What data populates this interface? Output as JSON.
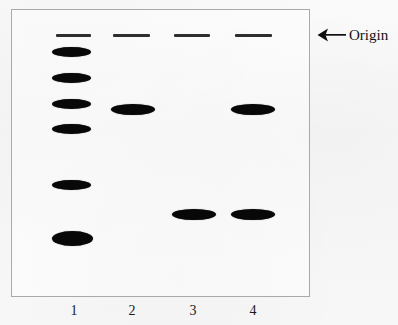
{
  "figure": {
    "type": "gel-electrophoresis-diagram",
    "background_color": "#f6f6f6",
    "band_color": "#080808",
    "plate_border_color": "#a9a9a9",
    "annotation": {
      "arrow_icon": "left-arrow-icon",
      "label": "Origin"
    },
    "plate": {
      "x": 11,
      "y": 9,
      "width": 299,
      "height": 288
    },
    "lanes": [
      {
        "number": "1",
        "label_x": 74,
        "origin": {
          "x": 56,
          "y": 34,
          "width": 35,
          "height": 3
        },
        "bands": [
          {
            "x": 52,
            "y": 47,
            "width": 39,
            "height": 10
          },
          {
            "x": 52,
            "y": 73,
            "width": 39,
            "height": 10
          },
          {
            "x": 52,
            "y": 99,
            "width": 39,
            "height": 10
          },
          {
            "x": 52,
            "y": 124,
            "width": 39,
            "height": 10
          },
          {
            "x": 52,
            "y": 180,
            "width": 39,
            "height": 10
          },
          {
            "x": 52,
            "y": 231,
            "width": 41,
            "height": 15
          }
        ]
      },
      {
        "number": "2",
        "label_x": 132,
        "origin": {
          "x": 113,
          "y": 34,
          "width": 37,
          "height": 3
        },
        "bands": [
          {
            "x": 111,
            "y": 104,
            "width": 44,
            "height": 11
          }
        ]
      },
      {
        "number": "3",
        "label_x": 193,
        "origin": {
          "x": 174,
          "y": 34,
          "width": 36,
          "height": 3
        },
        "bands": [
          {
            "x": 172,
            "y": 209,
            "width": 44,
            "height": 11
          }
        ]
      },
      {
        "number": "4",
        "label_x": 253,
        "origin": {
          "x": 235,
          "y": 34,
          "width": 37,
          "height": 3
        },
        "bands": [
          {
            "x": 231,
            "y": 104,
            "width": 44,
            "height": 11
          },
          {
            "x": 231,
            "y": 209,
            "width": 44,
            "height": 11
          }
        ]
      }
    ],
    "lane_label_y": 303
  }
}
